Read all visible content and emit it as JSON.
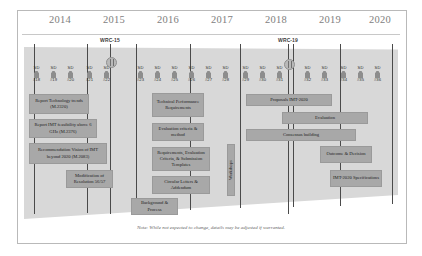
{
  "diagram": {
    "title_note": "Note: While not expected to change, details may be adjusted if warranted.",
    "years": [
      {
        "label": "2014",
        "x": 42
      },
      {
        "label": "2015",
        "x": 96
      },
      {
        "label": "2016",
        "x": 150
      },
      {
        "label": "2017",
        "x": 204
      },
      {
        "label": "2018",
        "x": 258
      },
      {
        "label": "2019",
        "x": 312
      },
      {
        "label": "2020",
        "x": 362
      }
    ],
    "wrc_markers": [
      {
        "label": "WRC-15",
        "x": 110
      },
      {
        "label": "WRC-19",
        "x": 288
      }
    ],
    "study_meetings": [
      {
        "title": "SD",
        "number": "#18",
        "x": 36
      },
      {
        "title": "SD",
        "number": "#19",
        "x": 53
      },
      {
        "title": "SD",
        "number": "#20",
        "x": 70
      },
      {
        "title": "SD",
        "number": "#21",
        "x": 89
      },
      {
        "title": "SD",
        "number": "#22",
        "x": 106
      },
      {
        "title": "SD",
        "number": "#23",
        "x": 140
      },
      {
        "title": "SD",
        "number": "#24",
        "x": 157
      },
      {
        "title": "SD",
        "number": "#25",
        "x": 174
      },
      {
        "title": "SD",
        "number": "#26",
        "x": 191
      },
      {
        "title": "SD",
        "number": "#27",
        "x": 208
      },
      {
        "title": "SD",
        "number": "#28",
        "x": 225
      },
      {
        "title": "SD",
        "number": "#29",
        "x": 245
      },
      {
        "title": "SD",
        "number": "#30",
        "x": 262
      },
      {
        "title": "SD",
        "number": "#31",
        "x": 279
      },
      {
        "title": "SD",
        "number": "#32",
        "x": 307
      },
      {
        "title": "SD",
        "number": "#33",
        "x": 324
      },
      {
        "title": "SD",
        "number": "#34",
        "x": 343
      },
      {
        "title": "SD",
        "number": "#35",
        "x": 360
      },
      {
        "title": "SD",
        "number": "#36",
        "x": 377
      }
    ],
    "tasks": [
      {
        "label": "Report Technology trends (M.2320)",
        "x": 29,
        "y": 94,
        "w": 60,
        "h": 20
      },
      {
        "label": "Report IMT feasibility above 6 GHz (M.2376)",
        "x": 29,
        "y": 119,
        "w": 68,
        "h": 19
      },
      {
        "label": "Recommendation Vision of IMT beyond 2020 (M.2083)",
        "x": 29,
        "y": 143,
        "w": 78,
        "h": 21
      },
      {
        "label": "Modification of Resolution 56/57",
        "x": 66,
        "y": 170,
        "w": 47,
        "h": 18
      },
      {
        "label": "Technical Performance Requirements",
        "x": 152,
        "y": 93,
        "w": 52,
        "h": 24
      },
      {
        "label": "Evaluation criteria & method",
        "x": 152,
        "y": 123,
        "w": 52,
        "h": 18
      },
      {
        "label": "Requirements, Evaluation Criteria, & Submission Templates",
        "x": 152,
        "y": 147,
        "w": 58,
        "h": 24
      },
      {
        "label": "Circular Letters & Addendum",
        "x": 152,
        "y": 176,
        "w": 58,
        "h": 18
      },
      {
        "label": "Background & Process",
        "x": 131,
        "y": 198,
        "w": 47,
        "h": 17
      },
      {
        "label": "Proposals IMT-2020",
        "x": 246,
        "y": 94,
        "w": 86,
        "h": 12
      },
      {
        "label": "Evaluation",
        "x": 282,
        "y": 112,
        "w": 86,
        "h": 12
      },
      {
        "label": "Consensus building",
        "x": 246,
        "y": 129,
        "w": 110,
        "h": 12
      },
      {
        "label": "Outcome & Decision",
        "x": 320,
        "y": 146,
        "w": 52,
        "h": 17
      },
      {
        "label": "IMT-2020 Specifications",
        "x": 330,
        "y": 170,
        "w": 52,
        "h": 17
      }
    ],
    "vertical_tasks": [
      {
        "label": "Workshops",
        "x": 227,
        "y": 144,
        "w": 8,
        "h": 52
      }
    ],
    "grid_lines_x": [
      34,
      87,
      136,
      190,
      240,
      293,
      340,
      392
    ],
    "colors": {
      "slab": "#d8d8d8",
      "box": "#a8a8a8",
      "year_text": "#7e7e7e",
      "frame_border": "#b9b9b9"
    }
  }
}
